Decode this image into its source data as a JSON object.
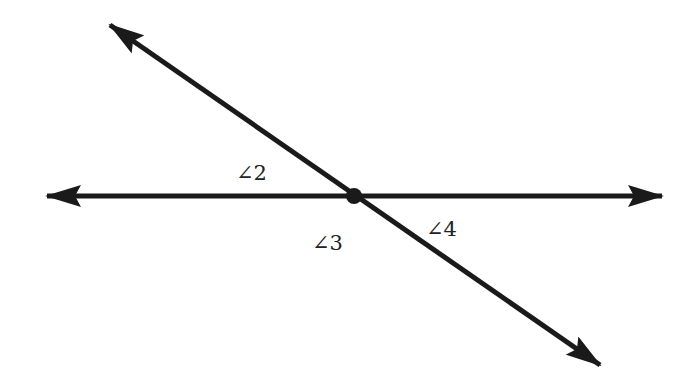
{
  "diagram": {
    "type": "intersecting-lines",
    "line_color": "#1a1a1a",
    "lines": [
      {
        "name": "horizontal-line",
        "x1": 47,
        "y1": 196,
        "x2": 662,
        "y2": 196
      },
      {
        "name": "transversal-line",
        "x1": 110,
        "y1": 25,
        "x2": 600,
        "y2": 365
      }
    ],
    "intersection": {
      "x": 354,
      "y": 196
    },
    "angle_labels": [
      {
        "id": "angle-2",
        "text": "∠2",
        "x": 236,
        "y": 180
      },
      {
        "id": "angle-3",
        "text": "∠3",
        "x": 312,
        "y": 250
      },
      {
        "id": "angle-4",
        "text": "∠4",
        "x": 426,
        "y": 236
      }
    ]
  }
}
